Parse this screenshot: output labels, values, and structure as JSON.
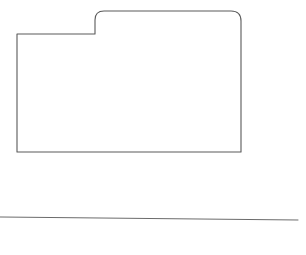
{
  "canvas": {
    "width": 306,
    "height": 255,
    "background_color": "#ffffff",
    "title": "Line drawing of a folder outline above a horizontal rule"
  },
  "style": {
    "stroke_color": "#5a5a5a",
    "line_stroke_color": "#6b6b6b",
    "stroke_width": 1.1,
    "line_stroke_width": 1.0,
    "fill": "none"
  },
  "shapes": [
    {
      "id": "folder-outline",
      "name": "folder-outline-shape",
      "type": "path",
      "description": "Closed rectilinear outline resembling a folder: a low left section and a taller right tab section, with rounded corners on the raised tab's top-left and the top-right.",
      "geometry": {
        "left_x": 17,
        "right_x": 241,
        "bottom_y": 152,
        "shoulder_y": 34,
        "tab_top_y": 11,
        "tab_start_x": 95,
        "corner_radius_tab_left": 9,
        "corner_radius_top_right": 10
      },
      "path_d": "M 17 34 L 86 34 L 95 34 L 95 20 Q 95 11 104 11 L 231 11 Q 241 11 241 21 L 241 152 L 17 152 Z"
    },
    {
      "id": "baseline-rule",
      "name": "horizontal-baseline-rule",
      "type": "line",
      "description": "A single long, very slightly downward-sloping horizontal rule beneath the folder shape.",
      "geometry": {
        "x1": 0,
        "y1": 217,
        "x2": 298,
        "y2": 220
      },
      "path_d": "M 0 217 L 298 220"
    }
  ]
}
